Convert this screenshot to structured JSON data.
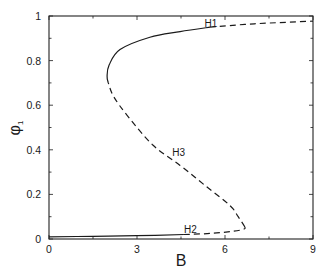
{
  "chart_data": {
    "type": "line",
    "title": "",
    "xlabel": "B",
    "ylabel": "φ1",
    "xlim": [
      0,
      9
    ],
    "ylim": [
      0,
      1
    ],
    "x_ticks": [
      "0",
      "3",
      "6",
      "9"
    ],
    "y_ticks": [
      "0",
      "0.2",
      "0.4",
      "0.6",
      "0.8",
      "1"
    ],
    "grid": false,
    "legend": null,
    "series": [
      {
        "name": "lower stable branch",
        "style": "solid",
        "points": [
          [
            0,
            0.01
          ],
          [
            1.5,
            0.012
          ],
          [
            3.0,
            0.015
          ],
          [
            4.6,
            0.02
          ]
        ]
      },
      {
        "name": "lower unstable branch",
        "style": "dashed",
        "points": [
          [
            4.6,
            0.02
          ],
          [
            5.5,
            0.025
          ],
          [
            6.3,
            0.035
          ],
          [
            6.65,
            0.045
          ],
          [
            6.68,
            0.054
          ]
        ]
      },
      {
        "name": "middle unstable branch",
        "style": "dashed",
        "points": [
          [
            6.68,
            0.054
          ],
          [
            6.45,
            0.1
          ],
          [
            6.17,
            0.15
          ],
          [
            5.32,
            0.24
          ],
          [
            4.47,
            0.33
          ],
          [
            3.55,
            0.42
          ],
          [
            2.69,
            0.55
          ],
          [
            2.2,
            0.64
          ],
          [
            2.02,
            0.7
          ]
        ]
      },
      {
        "name": "upper stable branch",
        "style": "solid",
        "points": [
          [
            2.02,
            0.7
          ],
          [
            1.98,
            0.73
          ],
          [
            2.05,
            0.78
          ],
          [
            2.42,
            0.85
          ],
          [
            3.44,
            0.905
          ],
          [
            4.47,
            0.93
          ],
          [
            5.49,
            0.95
          ]
        ]
      },
      {
        "name": "upper unstable branch",
        "style": "dashed",
        "points": [
          [
            5.49,
            0.95
          ],
          [
            7.0,
            0.965
          ],
          [
            9.0,
            0.977
          ]
        ]
      }
    ],
    "annotations": [
      {
        "text": "H1",
        "x": 5.3,
        "y": 0.97
      },
      {
        "text": "H2",
        "x": 4.6,
        "y": 0.045
      },
      {
        "text": "H3",
        "x": 4.2,
        "y": 0.39
      }
    ]
  }
}
